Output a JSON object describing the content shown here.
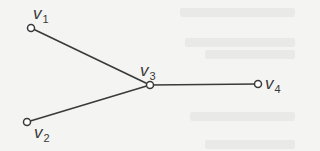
{
  "diagram": {
    "type": "graph",
    "colors": {
      "edge": "#3a3a3a",
      "node_fill": "#ffffff",
      "label": "#3a3a3a",
      "background": "#f4f4f2"
    },
    "nodes": [
      {
        "id": "v1",
        "base": "v",
        "sub": "1",
        "x": 31,
        "y": 28
      },
      {
        "id": "v2",
        "base": "v",
        "sub": "2",
        "x": 27,
        "y": 122
      },
      {
        "id": "v3",
        "base": "v",
        "sub": "3",
        "x": 150,
        "y": 85
      },
      {
        "id": "v4",
        "base": "v",
        "sub": "4",
        "x": 258,
        "y": 84
      }
    ],
    "edges": [
      {
        "from": "v1",
        "to": "v3"
      },
      {
        "from": "v2",
        "to": "v3"
      },
      {
        "from": "v3",
        "to": "v4"
      }
    ]
  }
}
